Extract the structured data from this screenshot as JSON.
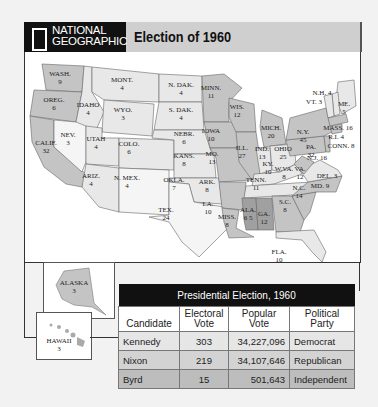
{
  "header": {
    "publisher_line1": "NATIONAL",
    "publisher_line2": "GEOGRAPHIC",
    "title": "Election of 1960"
  },
  "map": {
    "states": [
      {
        "abbr": "WASH.",
        "votes": "9"
      },
      {
        "abbr": "OREG.",
        "votes": "6"
      },
      {
        "abbr": "CALIF.",
        "votes": "32"
      },
      {
        "abbr": "IDAHO",
        "votes": "4"
      },
      {
        "abbr": "NEV.",
        "votes": "3"
      },
      {
        "abbr": "MONT.",
        "votes": "4"
      },
      {
        "abbr": "WYO.",
        "votes": "3"
      },
      {
        "abbr": "UTAH",
        "votes": "4"
      },
      {
        "abbr": "COLO.",
        "votes": "6"
      },
      {
        "abbr": "ARIZ.",
        "votes": "4"
      },
      {
        "abbr": "N. MEX.",
        "votes": "4"
      },
      {
        "abbr": "N. DAK.",
        "votes": "4"
      },
      {
        "abbr": "S. DAK.",
        "votes": "4"
      },
      {
        "abbr": "NEBR.",
        "votes": "6"
      },
      {
        "abbr": "KANS.",
        "votes": "8"
      },
      {
        "abbr": "OKLA.",
        "votes": "7"
      },
      {
        "abbr": "TEX.",
        "votes": "24"
      },
      {
        "abbr": "MINN.",
        "votes": "11"
      },
      {
        "abbr": "IOWA",
        "votes": "10"
      },
      {
        "abbr": "MO.",
        "votes": "13"
      },
      {
        "abbr": "ARK.",
        "votes": "8"
      },
      {
        "abbr": "LA.",
        "votes": "10"
      },
      {
        "abbr": "WIS.",
        "votes": "12"
      },
      {
        "abbr": "ILL.",
        "votes": "27"
      },
      {
        "abbr": "MICH.",
        "votes": "20"
      },
      {
        "abbr": "IND.",
        "votes": "13"
      },
      {
        "abbr": "OHIO",
        "votes": "25"
      },
      {
        "abbr": "KY.",
        "votes": "10"
      },
      {
        "abbr": "TENN.",
        "votes": "11"
      },
      {
        "abbr": "MISS.",
        "votes": "8"
      },
      {
        "abbr": "ALA.",
        "votes": "6 5"
      },
      {
        "abbr": "GA.",
        "votes": "12"
      },
      {
        "abbr": "FLA.",
        "votes": "10"
      },
      {
        "abbr": "S.C.",
        "votes": "8"
      },
      {
        "abbr": "N.C.",
        "votes": "14"
      },
      {
        "abbr": "VA.",
        "votes": "12"
      },
      {
        "abbr": "W. VA.",
        "votes": "8"
      },
      {
        "abbr": "PA.",
        "votes": "32"
      },
      {
        "abbr": "N.Y.",
        "votes": "45"
      },
      {
        "abbr": "ME.",
        "votes": "5"
      },
      {
        "abbr": "N.H.",
        "votes": "4"
      },
      {
        "abbr": "VT.",
        "votes": "3"
      },
      {
        "abbr": "MASS.",
        "votes": "16"
      },
      {
        "abbr": "R.I.",
        "votes": "4"
      },
      {
        "abbr": "CONN.",
        "votes": "8"
      },
      {
        "abbr": "N.J.",
        "votes": "16"
      },
      {
        "abbr": "DEL.",
        "votes": "3"
      },
      {
        "abbr": "MD.",
        "votes": "9"
      },
      {
        "abbr": "ALASKA",
        "votes": "3"
      },
      {
        "abbr": "HAWAII",
        "votes": "3"
      }
    ],
    "colors": {
      "kennedy": "#c4c4c4",
      "nixon": "#e8e8e8",
      "byrd": "#a0a0a0",
      "ocean": "#ffffff"
    }
  },
  "table": {
    "caption": "Presidential Election, 1960",
    "headers": [
      "Candidate",
      "Electoral Vote",
      "Popular Vote",
      "Political Party"
    ],
    "rows": [
      {
        "candidate": "Kennedy",
        "electoral": "303",
        "popular": "34,227,096",
        "party": "Democrat"
      },
      {
        "candidate": "Nixon",
        "electoral": "219",
        "popular": "34,107,646",
        "party": "Republican"
      },
      {
        "candidate": "Byrd",
        "electoral": "15",
        "popular": "501,643",
        "party": "Independent"
      }
    ]
  }
}
